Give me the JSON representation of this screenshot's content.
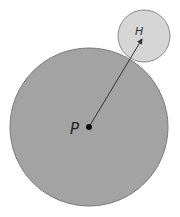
{
  "diagram": {
    "large_circle": {
      "label": "P",
      "cx": 89,
      "cy": 127,
      "r": 79,
      "fill": "#a3a3a3",
      "stroke": "#7a7a7a"
    },
    "small_circle": {
      "label": "H",
      "cx": 144,
      "cy": 36,
      "r": 26,
      "fill": "#d6d6d6",
      "stroke": "#8a8a8a"
    },
    "arrow": {
      "from": "P",
      "to": "H",
      "color": "#333333"
    },
    "labels": {
      "p": "P",
      "h": "H"
    }
  }
}
